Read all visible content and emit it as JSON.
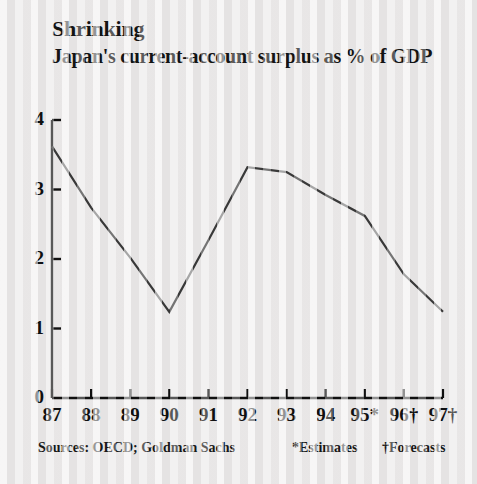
{
  "headline": "Shrinking",
  "subtitle": "Japan's current-account surplus as % of GDP",
  "footer": {
    "sources": "Sources: OECD; Goldman Sachs",
    "estimates_note": "*Estimates",
    "forecasts_note": "†Forecasts"
  },
  "axis": {
    "y_ticks": [
      "4",
      "3",
      "2",
      "1",
      "0"
    ],
    "x_ticks": [
      "87",
      "88",
      "89",
      "90",
      "91",
      "92",
      "93",
      "94",
      "95*",
      "96†",
      "97†"
    ]
  },
  "colors": {
    "line": "#3a3a3a",
    "axis": "#101010",
    "text": "#141414",
    "background": "#edebeb"
  },
  "chart_data": {
    "type": "line",
    "title": "Shrinking",
    "subtitle": "Japan's current-account surplus as % of GDP",
    "xlabel": "",
    "ylabel": "% of GDP",
    "categories": [
      "87",
      "88",
      "89",
      "90",
      "91",
      "92",
      "93",
      "94",
      "95",
      "96",
      "97"
    ],
    "tick_labels": [
      "87",
      "88",
      "89",
      "90",
      "91",
      "92",
      "93",
      "94",
      "95*",
      "96†",
      "97†"
    ],
    "values": [
      3.62,
      2.74,
      2.02,
      1.24,
      2.27,
      3.32,
      3.25,
      2.92,
      2.62,
      1.78,
      1.24
    ],
    "ylim": [
      0,
      4
    ],
    "ytick_values": [
      0,
      1,
      2,
      3,
      4
    ],
    "grid": false,
    "legend": false,
    "series_name": "Japan current-account surplus (% of GDP)",
    "annotations": [
      "* = Estimates (1995)",
      "† = Forecasts (1996, 1997)"
    ],
    "source": "Sources: OECD; Goldman Sachs"
  }
}
